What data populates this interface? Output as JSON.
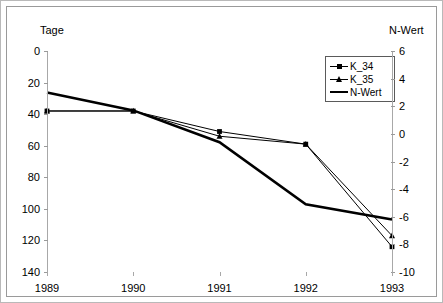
{
  "chart_data": {
    "type": "line",
    "title": "",
    "categories": [
      "1989",
      "1990",
      "1991",
      "1992",
      "1993"
    ],
    "xlabel": "",
    "ylabel": "Tage",
    "y2label": "N-Wert",
    "ylim": [
      140,
      0
    ],
    "y2lim": [
      -10,
      6
    ],
    "y_inverted": true,
    "grid": false,
    "legend_position": "top-right",
    "y_ticks": [
      "0",
      "20",
      "40",
      "60",
      "80",
      "100",
      "120",
      "140"
    ],
    "y_tick_values": [
      0,
      20,
      40,
      60,
      80,
      100,
      120,
      140
    ],
    "y2_ticks": [
      "6",
      "4",
      "2",
      "0",
      "-2",
      "-4",
      "-6",
      "-8",
      "-10"
    ],
    "y2_tick_values": [
      6,
      4,
      2,
      0,
      -2,
      -4,
      -6,
      -8,
      -10
    ],
    "series": [
      {
        "name": "K_34",
        "axis": "left",
        "marker": "square",
        "line": "thin",
        "values": [
          38,
          38,
          51,
          59,
          124
        ]
      },
      {
        "name": "K_35",
        "axis": "left",
        "marker": "triangle",
        "line": "thin",
        "values": [
          38,
          38,
          54,
          59,
          117
        ]
      },
      {
        "name": "N-Wert",
        "axis": "right",
        "marker": "none",
        "line": "thick",
        "values": [
          3.0,
          1.7,
          -0.6,
          -5.1,
          -6.2
        ]
      }
    ]
  },
  "axes": {
    "left_title": "Tage",
    "right_title": "N-Wert"
  },
  "legend": {
    "items": [
      {
        "label": "K_34",
        "marker": "square"
      },
      {
        "label": "K_35",
        "marker": "triangle"
      },
      {
        "label": "N-Wert",
        "marker": "line"
      }
    ]
  },
  "colors": {
    "series_line": "#000000",
    "frame": "#9a9a9a",
    "outer_frame": "#b9b9b9",
    "axis": "#a8a8a8"
  }
}
